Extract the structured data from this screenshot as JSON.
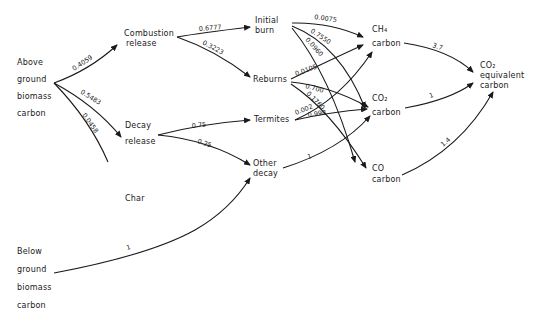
{
  "nodes": {
    "above": {
      "lines": [
        "Above",
        "ground",
        "biomass",
        "carbon"
      ]
    },
    "combustion": {
      "lines": [
        "Combustion",
        "release"
      ]
    },
    "decay": {
      "lines": [
        "Decay",
        "release"
      ]
    },
    "char": {
      "lines": [
        "Char"
      ]
    },
    "below": {
      "lines": [
        "Below",
        "ground",
        "biomass",
        "carbon"
      ]
    },
    "initial": {
      "lines": [
        "Initial",
        "burn"
      ]
    },
    "reburns": {
      "lines": [
        "Reburns"
      ]
    },
    "termites": {
      "lines": [
        "Termites"
      ]
    },
    "other": {
      "lines": [
        "Other",
        "decay"
      ]
    },
    "ch4": {
      "lines": [
        "CH₄",
        "carbon"
      ]
    },
    "co2": {
      "lines": [
        "CO₂",
        "carbon"
      ]
    },
    "co": {
      "lines": [
        "CO",
        "carbon"
      ]
    },
    "co2eq": {
      "lines": [
        "CO₂",
        "equivalent",
        "carbon"
      ]
    }
  },
  "edges": [
    {
      "from": "above",
      "to": "combustion",
      "label": "0.4059"
    },
    {
      "from": "above",
      "to": "decay",
      "label": "0.5483"
    },
    {
      "from": "above",
      "to": "char",
      "label": "0.0458"
    },
    {
      "from": "combustion",
      "to": "initial",
      "label": "0.6777"
    },
    {
      "from": "combustion",
      "to": "reburns",
      "label": "0.3223"
    },
    {
      "from": "decay",
      "to": "termites",
      "label": "0.75"
    },
    {
      "from": "decay",
      "to": "other",
      "label": "0.25"
    },
    {
      "from": "below",
      "to": "other",
      "label": "1"
    },
    {
      "from": "initial",
      "to": "ch4",
      "label": "0.0075"
    },
    {
      "from": "initial",
      "to": "co2",
      "label": "0.7550"
    },
    {
      "from": "initial",
      "to": "co",
      "label": "0.0960"
    },
    {
      "from": "reburns",
      "to": "ch4",
      "label": "0.0105"
    },
    {
      "from": "reburns",
      "to": "co2",
      "label": "0.700"
    },
    {
      "from": "reburns",
      "to": "co",
      "label": "0.1760"
    },
    {
      "from": "termites",
      "to": "ch4",
      "label": "0.002"
    },
    {
      "from": "termites",
      "to": "co2",
      "label": "0.998"
    },
    {
      "from": "other",
      "to": "co2",
      "label": "1"
    },
    {
      "from": "ch4",
      "to": "co2eq",
      "label": "3.7"
    },
    {
      "from": "co2",
      "to": "co2eq",
      "label": "1"
    },
    {
      "from": "co",
      "to": "co2eq",
      "label": "1.4"
    }
  ]
}
